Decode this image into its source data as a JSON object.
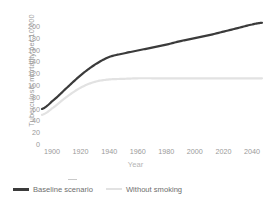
{
  "chart_data": {
    "type": "line",
    "title": "",
    "xlabel": "Year",
    "ylabel": "Tuberculosis mortality per 10,000",
    "xlim": [
      1893,
      2047
    ],
    "ylim": [
      0,
      210
    ],
    "xticks": [
      1900,
      1920,
      1940,
      1960,
      1980,
      2000,
      2020,
      2040
    ],
    "yticks": [
      0,
      20,
      40,
      60,
      80,
      100,
      120,
      140,
      160,
      180,
      200
    ],
    "grid": false,
    "legend_position": "bottom-left",
    "series": [
      {
        "name": "Baseline scenario",
        "color": "#3b3b3b",
        "x": [
          1893,
          1900,
          1910,
          1920,
          1930,
          1940,
          1950,
          1960,
          1970,
          1980,
          1990,
          2000,
          2010,
          2020,
          2030,
          2040,
          2047
        ],
        "values": [
          61,
          74,
          96,
          118,
          136,
          149,
          155,
          160,
          165,
          170,
          176,
          181,
          186,
          192,
          198,
          204,
          207
        ]
      },
      {
        "name": "Without smoking",
        "color": "#e2e2e2",
        "x": [
          1893,
          1900,
          1910,
          1920,
          1930,
          1940,
          1950,
          1960,
          1970,
          1980,
          1990,
          2000,
          2010,
          2020,
          2030,
          2040,
          2047
        ],
        "values": [
          51,
          62,
          81,
          97,
          107,
          111,
          112,
          113,
          113,
          113,
          113,
          113,
          113,
          113,
          113,
          113,
          113
        ]
      }
    ]
  },
  "axes": {
    "y_title": "Tuberculosis mortality per 10,000",
    "x_title": "Year",
    "y_tick_labels": [
      "200",
      "180",
      "160",
      "140",
      "120",
      "100",
      "80",
      "60",
      "40",
      "20",
      "0"
    ],
    "x_tick_labels": [
      "1900",
      "1920",
      "1940",
      "1960",
      "1980",
      "2000",
      "2020",
      "2040"
    ]
  },
  "legend": {
    "items": [
      {
        "label": "Baseline scenario",
        "color": "#3b3b3b",
        "style": "thick-solid"
      },
      {
        "label": "Without smoking",
        "color": "#e2e2e2",
        "style": "thin-solid"
      }
    ]
  }
}
